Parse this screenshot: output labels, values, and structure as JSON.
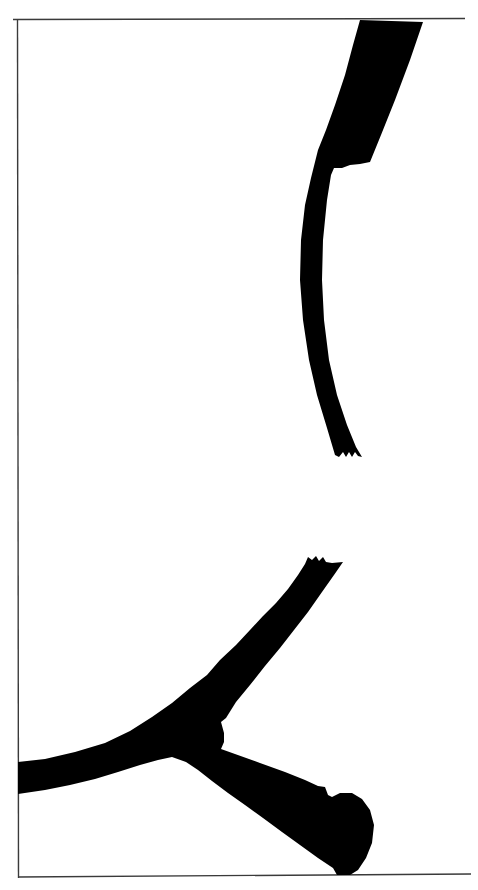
{
  "figure": {
    "background_color": "#ffffff",
    "silhouette_color": "#000000",
    "frame_color": "#3a3a3a",
    "elements": [
      {
        "id": "upper-fragment",
        "label": "Curved beam fragment with broad upper end and serrated broken lower tip"
      },
      {
        "id": "lower-fragment",
        "label": "Branched fragment with forked junction, serrated broken tine tip and rounded basal knob"
      }
    ],
    "caption": ""
  }
}
